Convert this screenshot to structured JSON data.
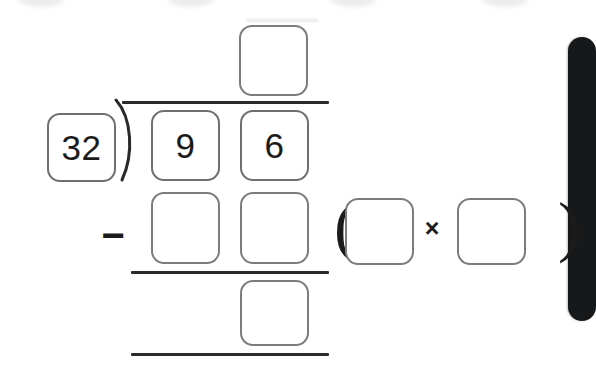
{
  "app": {
    "title": "Long Division Practice",
    "background_color": "#ffffff",
    "box_border_color": "#7b7b80",
    "rule_color": "#2a2a2a",
    "panel_color": "#17181a"
  },
  "problem": {
    "type": "long-division-with-partial-product",
    "divisor": "32",
    "dividend_digits": [
      "9",
      "6"
    ],
    "quotient_digits": [
      ""
    ],
    "subtrahend_digits": [
      "",
      ""
    ],
    "remainder_digits": [
      ""
    ],
    "check_expression": {
      "open_paren": "(",
      "left_factor": "",
      "operator": "×",
      "right_factor": "",
      "close_paren": ")"
    },
    "subtract_operator": "−"
  },
  "boxes": {
    "divisor": {
      "value": "32",
      "placeholder": "",
      "state": "filled"
    },
    "quotient_tens": {
      "value": "",
      "placeholder": "",
      "state": "empty"
    },
    "dividend_tens": {
      "value": "9",
      "placeholder": "",
      "state": "filled"
    },
    "dividend_ones": {
      "value": "6",
      "placeholder": "",
      "state": "filled"
    },
    "subtrahend_tens": {
      "value": "",
      "placeholder": "",
      "state": "empty"
    },
    "subtrahend_ones": {
      "value": "",
      "placeholder": "",
      "state": "empty"
    },
    "remainder_ones": {
      "value": "",
      "placeholder": "",
      "state": "empty"
    },
    "check_left": {
      "value": "",
      "placeholder": "",
      "state": "empty"
    },
    "check_right": {
      "value": "",
      "placeholder": "",
      "state": "empty"
    }
  },
  "icons": {
    "division_bracket": "division-bracket-icon",
    "multiplication": "multiplication-icon",
    "subtraction": "subtraction-icon"
  },
  "artifacts": {
    "top_smudges": 4,
    "right_panel_visible": true
  }
}
